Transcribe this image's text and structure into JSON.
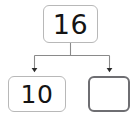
{
  "diagram": {
    "type": "number-bond",
    "background_color": "#ffffff",
    "line_color": "#8a8a8a",
    "text_color": "#141414"
  },
  "nodes": {
    "whole": {
      "label": "16",
      "role": "whole",
      "border_color": "#b8b8b8",
      "filled": true
    },
    "part_one": {
      "label": "10",
      "role": "part",
      "border_color": "#b8b8b8",
      "filled": true
    },
    "part_two": {
      "label": "",
      "role": "part-answer-blank",
      "border_color": "#6e6e72",
      "filled": false
    }
  },
  "connectors": [
    {
      "name": "whole-to-part-one",
      "from": "whole",
      "to": "part_one",
      "arrowhead": "filled-triangle"
    },
    {
      "name": "whole-to-part-two",
      "from": "whole",
      "to": "part_two",
      "arrowhead": "filled-triangle"
    }
  ]
}
